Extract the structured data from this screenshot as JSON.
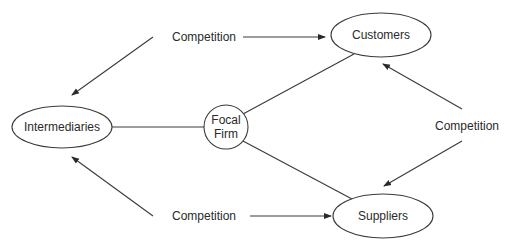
{
  "diagram": {
    "type": "competitive-relationships",
    "colors": {
      "line": "#3a3a3a",
      "text": "#2a2a2a",
      "background": "#ffffff"
    },
    "nodes": {
      "intermediaries": {
        "label": "Intermediaries",
        "shape": "ellipse"
      },
      "focal_firm": {
        "label_line1": "Focal",
        "label_line2": "Firm",
        "shape": "circle"
      },
      "customers": {
        "label": "Customers",
        "shape": "ellipse"
      },
      "suppliers": {
        "label": "Suppliers",
        "shape": "ellipse"
      }
    },
    "competition_labels": {
      "top": "Competition",
      "bottom": "Competition",
      "right": "Competition"
    },
    "edges": [
      {
        "from": "focal_firm",
        "to": "intermediaries",
        "type": "line"
      },
      {
        "from": "focal_firm",
        "to": "customers",
        "type": "line"
      },
      {
        "from": "focal_firm",
        "to": "suppliers",
        "type": "line"
      },
      {
        "from": "competition_top",
        "to": "intermediaries",
        "type": "arrow"
      },
      {
        "from": "competition_top",
        "to": "customers",
        "type": "arrow"
      },
      {
        "from": "competition_bottom",
        "to": "intermediaries",
        "type": "arrow"
      },
      {
        "from": "competition_bottom",
        "to": "suppliers",
        "type": "arrow"
      },
      {
        "from": "competition_right",
        "to": "customers",
        "type": "arrow"
      },
      {
        "from": "competition_right",
        "to": "suppliers",
        "type": "arrow"
      }
    ]
  }
}
